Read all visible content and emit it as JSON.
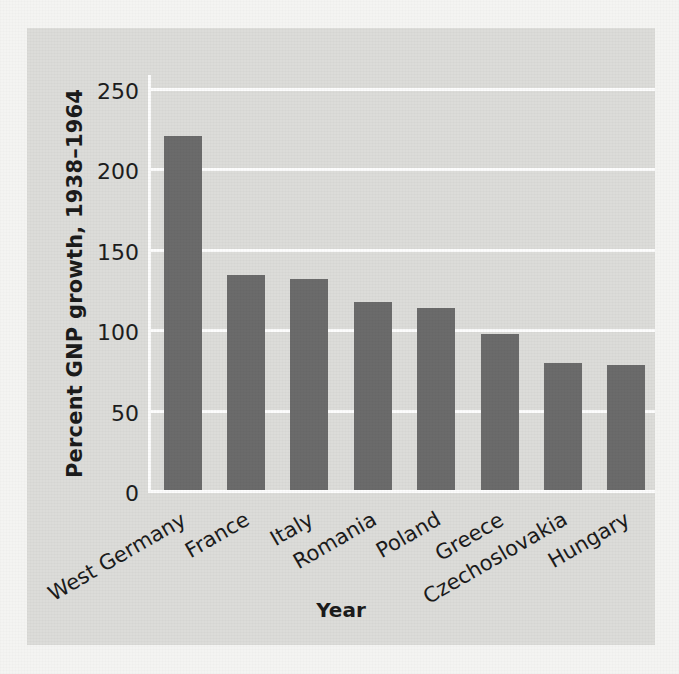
{
  "chart_data": {
    "type": "bar",
    "title": "",
    "subtitle": "",
    "xlabel": "Year",
    "ylabel": "Percent GNP growth, 1938–1964",
    "categories": [
      "West Germany",
      "France",
      "Italy",
      "Romania",
      "Poland",
      "Greece",
      "Czechoslovakia",
      "Hungary"
    ],
    "values": [
      220,
      134,
      131,
      117,
      113,
      97,
      79,
      78
    ],
    "ylim": [
      0,
      260
    ],
    "yticks": [
      0,
      50,
      100,
      150,
      200,
      250
    ],
    "ytick_labels": [
      "0",
      "50",
      "100",
      "150",
      "200",
      "250"
    ],
    "grid": true,
    "grid_axis": "y",
    "legend": "none",
    "bar_color": "#6b6b6b",
    "panel_color": "#dcdcd9",
    "gridline_color": "#fdfdfd",
    "figure_color": "#f4f4f2",
    "text_color": "#1b1b1b",
    "xtick_label_rotation": -30,
    "annotations": []
  },
  "axes": {
    "y_title": "Percent GNP growth, 1938–1964",
    "x_title": "Year"
  }
}
